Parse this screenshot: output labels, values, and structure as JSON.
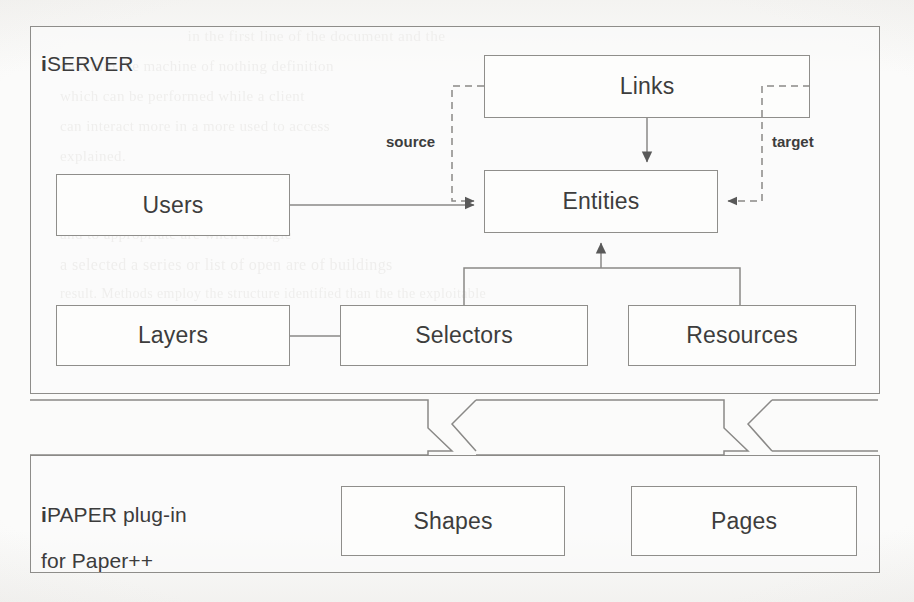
{
  "figure": {
    "type": "architecture-block-diagram",
    "background": "#fbfbfa",
    "line_color": "#8f8e8b",
    "text_color": "#3d3d3d"
  },
  "panels": [
    {
      "id": "iserver",
      "title_prefix": "i",
      "title_rest": "SERVER",
      "title_full": "iSERVER"
    },
    {
      "id": "ipaper",
      "title_prefix": "i",
      "title_rest": "PAPER plug-in",
      "title_line2": "for Paper++",
      "title_full": "iPAPER plug-in for Paper++"
    }
  ],
  "nodes": [
    {
      "id": "links",
      "label": "Links",
      "panel": "iserver"
    },
    {
      "id": "entities",
      "label": "Entities",
      "panel": "iserver"
    },
    {
      "id": "users",
      "label": "Users",
      "panel": "iserver"
    },
    {
      "id": "layers",
      "label": "Layers",
      "panel": "iserver"
    },
    {
      "id": "selectors",
      "label": "Selectors",
      "panel": "iserver"
    },
    {
      "id": "resources",
      "label": "Resources",
      "panel": "iserver"
    },
    {
      "id": "shapes",
      "label": "Shapes",
      "panel": "ipaper"
    },
    {
      "id": "pages",
      "label": "Pages",
      "panel": "ipaper"
    }
  ],
  "edge_labels": [
    {
      "id": "source",
      "label": "source"
    },
    {
      "id": "target",
      "label": "target"
    }
  ],
  "connections": [
    {
      "from": "links",
      "to": "entities",
      "style": "solid",
      "arrow": "down",
      "note": "Links refer to Entities"
    },
    {
      "from": "links",
      "to": "entities",
      "style": "dashed",
      "arrow": "right",
      "note": "source"
    },
    {
      "from": "links",
      "to": "entities",
      "style": "dashed",
      "arrow": "left",
      "note": "target"
    },
    {
      "from": "users",
      "to": "entities",
      "style": "solid",
      "arrow": "right"
    },
    {
      "from": "selectors",
      "to": "entities",
      "style": "solid",
      "arrow": "up"
    },
    {
      "from": "resources",
      "to": "entities",
      "style": "solid",
      "arrow": "up"
    },
    {
      "from": "layers",
      "to": "selectors",
      "style": "solid",
      "arrow": "none"
    },
    {
      "from": "selectors",
      "to": "shapes",
      "style": "broken-band",
      "arrow": "none"
    },
    {
      "from": "resources",
      "to": "pages",
      "style": "broken-band",
      "arrow": "none"
    }
  ],
  "scan_artifacts": {
    "bleed_through_lines": [
      "in the first line of the document and the",
      "data into the machine of nothing definition",
      "which can be performed while a client",
      "can interact more in a more used to access",
      "explained.",
      "The model as constructed the some",
      "and to appropriate are when a single",
      "a selected a series or list of open are of buildings",
      "result. Methods employ the structure identified than the the exploitable",
      "the other part",
      "the model"
    ]
  }
}
